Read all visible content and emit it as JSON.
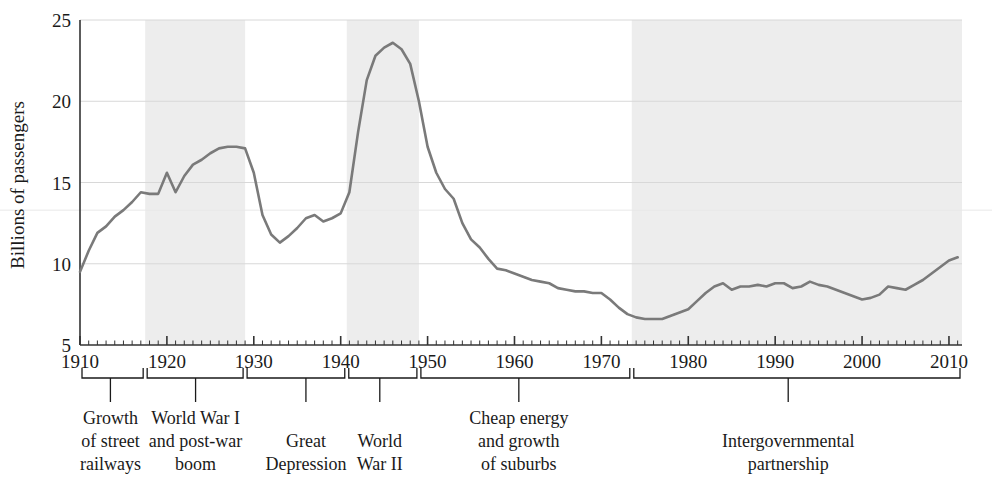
{
  "chart_data": {
    "type": "line",
    "title": "",
    "subtitle": "",
    "xlabel": "",
    "ylabel": "Billions of passengers",
    "xlim": [
      1910,
      2011.5
    ],
    "ylim": [
      5,
      25
    ],
    "grid": true,
    "legend": null,
    "yticks": [
      5,
      10,
      15,
      20,
      25
    ],
    "ytick_labels": [
      "5",
      "10",
      "15",
      "20",
      "25"
    ],
    "xticks": [
      1910,
      1920,
      1930,
      1940,
      1950,
      1960,
      1970,
      1980,
      1990,
      2000,
      2010
    ],
    "xtick_labels": [
      "1910",
      "1920",
      "1930",
      "1940",
      "1950",
      "1960",
      "1970",
      "1980",
      "1990",
      "2000",
      "2010"
    ],
    "minor_xtick_interval": 1,
    "series": [
      {
        "name": "Transit ridership",
        "color": "#7a7a7a",
        "x": [
          1910,
          1911,
          1912,
          1913,
          1914,
          1915,
          1916,
          1917,
          1918,
          1919,
          1920,
          1921,
          1922,
          1923,
          1924,
          1925,
          1926,
          1927,
          1928,
          1929,
          1930,
          1931,
          1932,
          1933,
          1934,
          1935,
          1936,
          1937,
          1938,
          1939,
          1940,
          1941,
          1942,
          1943,
          1944,
          1945,
          1946,
          1947,
          1948,
          1949,
          1950,
          1951,
          1952,
          1953,
          1954,
          1955,
          1956,
          1957,
          1958,
          1959,
          1960,
          1961,
          1962,
          1963,
          1964,
          1965,
          1966,
          1967,
          1968,
          1969,
          1970,
          1971,
          1972,
          1973,
          1974,
          1975,
          1976,
          1977,
          1978,
          1979,
          1980,
          1981,
          1982,
          1983,
          1984,
          1985,
          1986,
          1987,
          1988,
          1989,
          1990,
          1991,
          1992,
          1993,
          1994,
          1995,
          1996,
          1997,
          1998,
          1999,
          2000,
          2001,
          2002,
          2003,
          2004,
          2005,
          2006,
          2007,
          2008,
          2009,
          2010,
          2011
        ],
        "y": [
          9.5,
          10.8,
          11.9,
          12.3,
          12.9,
          13.3,
          13.8,
          14.4,
          14.3,
          14.3,
          15.6,
          14.4,
          15.4,
          16.1,
          16.4,
          16.8,
          17.1,
          17.2,
          17.2,
          17.1,
          15.6,
          13.0,
          11.8,
          11.3,
          11.7,
          12.2,
          12.8,
          13.0,
          12.6,
          12.8,
          13.1,
          14.4,
          18.1,
          21.3,
          22.8,
          23.3,
          23.6,
          23.2,
          22.3,
          20.0,
          17.2,
          15.6,
          14.6,
          14.0,
          12.5,
          11.5,
          11.0,
          10.3,
          9.7,
          9.6,
          9.4,
          9.2,
          9.0,
          8.9,
          8.8,
          8.5,
          8.4,
          8.3,
          8.3,
          8.2,
          8.2,
          7.8,
          7.3,
          6.9,
          6.7,
          6.6,
          6.6,
          6.6,
          6.8,
          7.0,
          7.2,
          7.7,
          8.2,
          8.6,
          8.8,
          8.4,
          8.6,
          8.6,
          8.7,
          8.6,
          8.8,
          8.8,
          8.5,
          8.6,
          8.9,
          8.7,
          8.6,
          8.4,
          8.2,
          8.0,
          7.8,
          7.9,
          8.1,
          8.6,
          8.5,
          8.4,
          8.7,
          9.0,
          9.4,
          9.8,
          10.2,
          10.4
        ]
      }
    ],
    "shaded_bands": [
      {
        "name": "World War I and post-war boom",
        "start": 1917.5,
        "end": 1929.0
      },
      {
        "name": "World War II",
        "start": 1940.7,
        "end": 1949.0
      },
      {
        "name": "Intergovernmental partnership",
        "start": 1973.5,
        "end": 2011.5
      }
    ],
    "band_color": "#ededed",
    "annotations": [
      {
        "label": "Growth\nof street\nrailways",
        "lines": [
          "Growth",
          "of street",
          "railways"
        ],
        "start": 1910,
        "end": 1917.5,
        "center": 1913.5
      },
      {
        "label": "World War I\nand post-war\nboom",
        "lines": [
          "World War I",
          "and post-war",
          "boom"
        ],
        "start": 1917.5,
        "end": 1929.0,
        "center": 1923.3
      },
      {
        "label": "Great\nDepression",
        "lines": [
          "Great",
          "Depression"
        ],
        "start": 1929.0,
        "end": 1940.7,
        "center": 1936.0
      },
      {
        "label": "World\nWar II",
        "lines": [
          "World",
          "War II"
        ],
        "start": 1940.7,
        "end": 1949.0,
        "center": 1944.5
      },
      {
        "label": "Cheap energy\nand growth\nof suburbs",
        "lines": [
          "Cheap energy",
          "and growth",
          "of suburbs"
        ],
        "start": 1949.0,
        "end": 1973.5,
        "center": 1960.5
      },
      {
        "label": "Intergovernmental\npartnership",
        "lines": [
          "Intergovernmental",
          "partnership"
        ],
        "start": 1973.5,
        "end": 2011.5,
        "center": 1991.5
      }
    ]
  }
}
